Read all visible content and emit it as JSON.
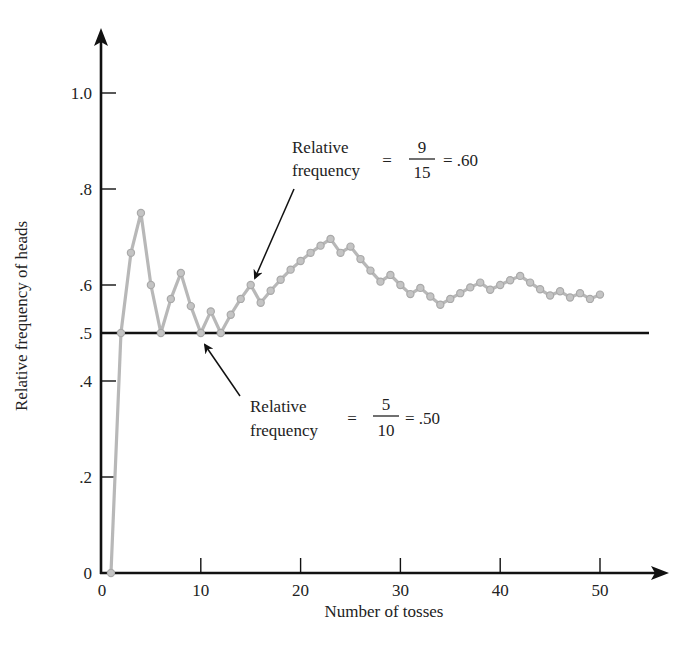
{
  "chart_data": {
    "type": "line",
    "title": "",
    "xlabel": "Number of tosses",
    "ylabel": "Relative frequency of heads",
    "xlim": [
      0,
      55
    ],
    "ylim": [
      0,
      1.1
    ],
    "grid": false,
    "legend": null,
    "x_ticks": [
      0,
      10,
      20,
      30,
      40,
      50
    ],
    "x_tick_labels": [
      "0",
      "10",
      "20",
      "30",
      "40",
      "50"
    ],
    "y_ticks": [
      0,
      0.2,
      0.4,
      0.5,
      0.6,
      0.8,
      1.0
    ],
    "y_tick_labels": [
      "0",
      ".2",
      ".4",
      ".5",
      ".6",
      ".8",
      "1.0"
    ],
    "reference_line": {
      "y": 0.5,
      "label": ""
    },
    "series": [
      {
        "name": "Relative frequency of heads",
        "color": "#b8b8b8",
        "x": [
          1,
          2,
          3,
          4,
          5,
          6,
          7,
          8,
          9,
          10,
          11,
          12,
          13,
          14,
          15,
          16,
          17,
          18,
          19,
          20,
          21,
          22,
          23,
          24,
          25,
          26,
          27,
          28,
          29,
          30,
          31,
          32,
          33,
          34,
          35,
          36,
          37,
          38,
          39,
          40,
          41,
          42,
          43,
          44,
          45,
          46,
          47,
          48,
          49,
          50
        ],
        "heads": [
          0,
          1,
          2,
          3,
          3,
          3,
          4,
          5,
          5,
          5,
          6,
          6,
          7,
          8,
          9,
          9,
          10,
          11,
          12,
          13,
          14,
          15,
          16,
          16,
          17,
          17,
          17,
          17,
          18,
          18,
          18,
          19,
          19,
          19,
          20,
          21,
          22,
          23,
          23,
          24,
          25,
          26,
          26,
          26,
          26,
          27,
          27,
          28,
          28,
          29
        ],
        "values": [
          0.0,
          0.5,
          0.667,
          0.75,
          0.6,
          0.5,
          0.571,
          0.625,
          0.556,
          0.5,
          0.545,
          0.5,
          0.538,
          0.571,
          0.6,
          0.563,
          0.588,
          0.611,
          0.632,
          0.65,
          0.667,
          0.682,
          0.696,
          0.667,
          0.68,
          0.654,
          0.63,
          0.607,
          0.621,
          0.6,
          0.581,
          0.594,
          0.576,
          0.559,
          0.571,
          0.583,
          0.595,
          0.605,
          0.59,
          0.6,
          0.61,
          0.619,
          0.605,
          0.591,
          0.578,
          0.587,
          0.574,
          0.583,
          0.571,
          0.58
        ]
      }
    ],
    "annotations": [
      {
        "id": "upper",
        "line1": "Relative",
        "line2": "frequency",
        "equals": "=",
        "numerator": "9",
        "denominator": "15",
        "result": "= .60",
        "points_to": {
          "x": 15,
          "y": 0.6
        }
      },
      {
        "id": "lower",
        "line1": "Relative",
        "line2": "frequency",
        "equals": "=",
        "numerator": "5",
        "denominator": "10",
        "result": "= .50",
        "points_to": {
          "x": 10,
          "y": 0.5
        }
      }
    ]
  },
  "layout": {
    "x0_px": 101,
    "px_per_x": 9.98,
    "y0_px": 573,
    "px_per_y": 480,
    "axis_color": "#111111",
    "line_color": "#b8b8b8",
    "marker_fill": "#c4c4c4",
    "marker_stroke": "#a9a9a9"
  }
}
